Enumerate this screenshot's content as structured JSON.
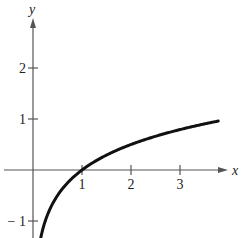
{
  "chart_data": {
    "type": "line",
    "title": "",
    "xlabel": "x",
    "ylabel": "y",
    "function": "y = log_4(x)",
    "xlim": [
      -0.65,
      4.1
    ],
    "ylim": [
      -1.33,
      3.3
    ],
    "x_ticks": [
      1,
      2,
      3
    ],
    "x_tick_labels": [
      "1",
      "2",
      "3"
    ],
    "y_ticks": [
      -1,
      1,
      2
    ],
    "y_tick_labels": [
      "− 1",
      "1",
      "2"
    ],
    "grid": false,
    "legend": null,
    "series": [
      {
        "name": "curve",
        "x": [
          0.18,
          0.25,
          0.35,
          0.5,
          0.75,
          1,
          1.5,
          2,
          2.5,
          3,
          3.5,
          3.78
        ],
        "y": [
          -1.24,
          -1.0,
          -0.76,
          -0.5,
          -0.21,
          0,
          0.29,
          0.5,
          0.66,
          0.79,
          0.9,
          0.96
        ]
      }
    ],
    "annotations": []
  },
  "colors": {
    "axis": "#555555",
    "curve": "#111111",
    "text": "#222222"
  }
}
